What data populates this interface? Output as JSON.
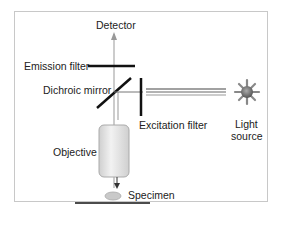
{
  "diagram": {
    "labels": {
      "detector": "Detector",
      "emission_filter": "Emission filter",
      "dichroic_mirror": "Dichroic mirror",
      "excitation_filter": "Excitation filter",
      "light_source_line1": "Light",
      "light_source_line2": "source",
      "objective": "Objective",
      "specimen": "Specimen"
    },
    "colors": {
      "line": "#111111",
      "beam": "#888888",
      "objective_fill": "#e2e2e2",
      "light_source": "#7a7a7a",
      "frame_border": "#c8c8c8"
    }
  }
}
